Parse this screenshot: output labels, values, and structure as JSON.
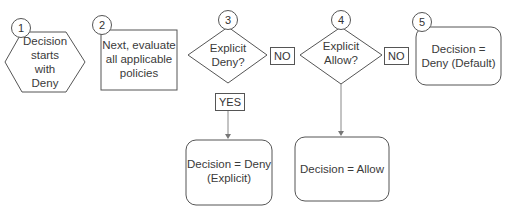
{
  "diagram": {
    "type": "flowchart",
    "title": "",
    "steps": [
      {
        "number": "1",
        "shape": "hexagon",
        "text_lines": [
          "Decision",
          "starts",
          "with",
          "Deny"
        ]
      },
      {
        "number": "2",
        "shape": "rectangle",
        "text_lines": [
          "Next, evaluate",
          "all applicable",
          "policies"
        ]
      },
      {
        "number": "3",
        "shape": "diamond",
        "text_lines": [
          "Explicit",
          "Deny?"
        ]
      },
      {
        "number": "4",
        "shape": "diamond",
        "text_lines": [
          "Explicit",
          "Allow?"
        ]
      },
      {
        "number": "5",
        "shape": "rounded-rectangle",
        "text_lines": [
          "Decision =",
          "Deny (Default)"
        ]
      }
    ],
    "outcomes": {
      "explicit_deny": {
        "shape": "rounded-rectangle",
        "text_lines": [
          "Decision = Deny",
          "(Explicit)"
        ]
      },
      "allow": {
        "shape": "rounded-rectangle",
        "text_lines": [
          "Decision = Allow"
        ]
      }
    },
    "edge_labels": {
      "deny_no": "NO",
      "deny_yes": "YES",
      "allow_no": "NO"
    },
    "edges": [
      {
        "from": "3",
        "to": "4",
        "label": "NO"
      },
      {
        "from": "3",
        "to": "explicit_deny",
        "label": "YES"
      },
      {
        "from": "4",
        "to": "5",
        "label": "NO"
      },
      {
        "from": "4",
        "to": "allow",
        "label": ""
      }
    ],
    "colors": {
      "stroke": "#555555",
      "text": "#333333",
      "arrow": "#777777",
      "background": "#ffffff"
    }
  }
}
